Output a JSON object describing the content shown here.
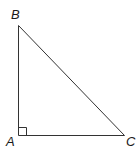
{
  "diagram": {
    "type": "right-triangle",
    "stroke_color": "#333333",
    "vertices": [
      {
        "id": "A",
        "label": "A",
        "x": 18,
        "y": 135,
        "label_x": 6,
        "label_y": 146
      },
      {
        "id": "B",
        "label": "B",
        "x": 18,
        "y": 25,
        "label_x": 11,
        "label_y": 19
      },
      {
        "id": "C",
        "label": "C",
        "x": 124,
        "y": 135,
        "label_x": 126,
        "label_y": 146
      }
    ],
    "edges": [
      {
        "from": "A",
        "to": "B"
      },
      {
        "from": "B",
        "to": "C"
      },
      {
        "from": "A",
        "to": "C"
      }
    ],
    "right_angle_marker": {
      "at": "A",
      "size": 8
    }
  }
}
